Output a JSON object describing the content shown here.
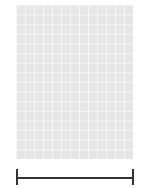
{
  "chart_title": "Knitting stitch chart",
  "grid": {
    "columns": 13,
    "rows": 16,
    "cell_bg": "#e6e6e6",
    "symbol_color": "#666666"
  },
  "row_labels_left": [
    "16",
    "14",
    "12",
    "10",
    "8",
    "6",
    "4",
    "2"
  ],
  "row_labels_right": [
    "15",
    "13",
    "11",
    "9",
    "7",
    "5",
    "3",
    "1"
  ],
  "legend_symbols": {
    "ssk": "◣ left-leaning decrease",
    "yo": "○ yarn over",
    "k2tog": "◢ right-leaning decrease",
    "cdd": "∧ centered double decrease",
    "bobble": "• bobble/purl",
    "nostitch": "▬ no stitch",
    "dark": "■ no stitch (dark)"
  },
  "cells": [
    {
      "row": 16,
      "col": 6,
      "s": "dot"
    },
    {
      "row": 16,
      "col": 9,
      "s": "dot"
    },
    {
      "row": 15,
      "col": 4,
      "s": "ssk"
    },
    {
      "row": 15,
      "col": 5,
      "s": "yo"
    },
    {
      "row": 15,
      "col": 6,
      "s": "yo"
    },
    {
      "row": 15,
      "col": 7,
      "s": "cdd"
    },
    {
      "row": 15,
      "col": 8,
      "s": "yo"
    },
    {
      "row": 15,
      "col": 9,
      "s": "yo"
    },
    {
      "row": 15,
      "col": 10,
      "s": "k2tog"
    },
    {
      "row": 14,
      "col": 5,
      "s": "dot"
    },
    {
      "row": 14,
      "col": 10,
      "s": "dot"
    },
    {
      "row": 13,
      "col": 3,
      "s": "ssk"
    },
    {
      "row": 13,
      "col": 4,
      "s": "yo"
    },
    {
      "row": 13,
      "col": 5,
      "s": "yo"
    },
    {
      "row": 13,
      "col": 6,
      "s": "k2tog"
    },
    {
      "row": 13,
      "col": 8,
      "s": "ssk"
    },
    {
      "row": 13,
      "col": 9,
      "s": "yo"
    },
    {
      "row": 13,
      "col": 10,
      "s": "yo"
    },
    {
      "row": 13,
      "col": 11,
      "s": "k2tog"
    },
    {
      "row": 12,
      "col": 4,
      "s": "dot"
    },
    {
      "row": 12,
      "col": 11,
      "s": "dot"
    },
    {
      "row": 11,
      "col": 2,
      "s": "ssk"
    },
    {
      "row": 11,
      "col": 3,
      "s": "yo"
    },
    {
      "row": 11,
      "col": 4,
      "s": "yo"
    },
    {
      "row": 11,
      "col": 5,
      "s": "k2tog"
    },
    {
      "row": 11,
      "col": 9,
      "s": "ssk"
    },
    {
      "row": 11,
      "col": 10,
      "s": "yo"
    },
    {
      "row": 11,
      "col": 11,
      "s": "yo"
    },
    {
      "row": 11,
      "col": 12,
      "s": "k2tog"
    },
    {
      "row": 10,
      "col": 3,
      "s": "dot"
    },
    {
      "row": 10,
      "col": 12,
      "s": "dot"
    },
    {
      "row": 9,
      "col": 1,
      "s": "ssk"
    },
    {
      "row": 9,
      "col": 2,
      "s": "yo"
    },
    {
      "row": 9,
      "col": 3,
      "s": "yo"
    },
    {
      "row": 9,
      "col": 4,
      "s": "k2tog"
    },
    {
      "row": 9,
      "col": 10,
      "s": "ssk"
    },
    {
      "row": 9,
      "col": 11,
      "s": "yo"
    },
    {
      "row": 9,
      "col": 12,
      "s": "yo"
    },
    {
      "row": 9,
      "col": 13,
      "s": "k2tog"
    },
    {
      "row": 8,
      "col": 4,
      "s": "dot"
    },
    {
      "row": 8,
      "col": 11,
      "s": "dot"
    },
    {
      "row": 7,
      "col": 2,
      "s": "ssk"
    },
    {
      "row": 7,
      "col": 3,
      "s": "yo"
    },
    {
      "row": 7,
      "col": 4,
      "s": "yo"
    },
    {
      "row": 7,
      "col": 5,
      "s": "k2tog"
    },
    {
      "row": 7,
      "col": 9,
      "s": "ssk"
    },
    {
      "row": 7,
      "col": 10,
      "s": "yo"
    },
    {
      "row": 7,
      "col": 11,
      "s": "yo"
    },
    {
      "row": 7,
      "col": 12,
      "s": "k2tog"
    },
    {
      "row": 6,
      "col": 5,
      "s": "dot"
    },
    {
      "row": 6,
      "col": 10,
      "s": "dot"
    },
    {
      "row": 5,
      "col": 3,
      "s": "ssk"
    },
    {
      "row": 5,
      "col": 4,
      "s": "yo"
    },
    {
      "row": 5,
      "col": 5,
      "s": "yo"
    },
    {
      "row": 5,
      "col": 6,
      "s": "k2tog"
    },
    {
      "row": 5,
      "col": 8,
      "s": "ssk"
    },
    {
      "row": 5,
      "col": 9,
      "s": "yo"
    },
    {
      "row": 5,
      "col": 10,
      "s": "yo"
    },
    {
      "row": 5,
      "col": 11,
      "s": "k2tog"
    },
    {
      "row": 4,
      "col": 6,
      "s": "dot"
    },
    {
      "row": 4,
      "col": 9,
      "s": "dot"
    },
    {
      "row": 3,
      "col": 4,
      "s": "ssk"
    },
    {
      "row": 3,
      "col": 5,
      "s": "yo"
    },
    {
      "row": 3,
      "col": 6,
      "s": "yo"
    },
    {
      "row": 3,
      "col": 7,
      "s": "ssk"
    },
    {
      "row": 3,
      "col": 8,
      "s": "yo"
    },
    {
      "row": 3,
      "col": 9,
      "s": "yo"
    },
    {
      "row": 3,
      "col": 10,
      "s": "k2tog"
    },
    {
      "row": 2,
      "col": 8,
      "s": "dot"
    },
    {
      "row": 1,
      "col": 5,
      "s": "cdd"
    },
    {
      "row": 1,
      "col": 7,
      "s": "yo"
    },
    {
      "row": 1,
      "col": 8,
      "s": "yo"
    },
    {
      "row": 1,
      "col": 9,
      "s": "k2tog"
    }
  ],
  "dark_blocks": [
    {
      "col": 6,
      "row_from": 1,
      "row_to": 2
    }
  ],
  "no_stitch_bars": [
    {
      "row": 9,
      "col_from": 6,
      "col_to": 8
    }
  ],
  "scale_bar": {
    "present": true
  }
}
